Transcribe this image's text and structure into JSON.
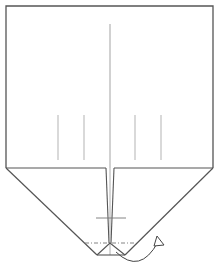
{
  "diagram": {
    "type": "origami-fold-step",
    "colors": {
      "background": "#ffffff",
      "edge": "#555555",
      "crease": "#9a9a9a",
      "valley": "#777777",
      "arrow": "#444444"
    },
    "paper": {
      "rect": {
        "x1": 6,
        "y1": 6,
        "x2": 213,
        "y2": 168
      },
      "left_flap": [
        [
          6,
          168
        ],
        [
          106,
          168
        ],
        [
          106,
          243
        ],
        [
          97,
          255
        ]
      ],
      "right_flap": [
        [
          213,
          168
        ],
        [
          114,
          168
        ],
        [
          114,
          243
        ],
        [
          125,
          255
        ]
      ]
    },
    "creases": {
      "center": {
        "x": 110,
        "y1": 24,
        "y2": 255
      },
      "short_verticals": [
        {
          "x": 58,
          "y1": 115,
          "y2": 160
        },
        {
          "x": 84,
          "y1": 115,
          "y2": 160
        },
        {
          "x": 135,
          "y1": 115,
          "y2": 160
        },
        {
          "x": 161,
          "y1": 115,
          "y2": 160
        }
      ],
      "cross_tick": {
        "x1": 96,
        "x2": 126,
        "y": 218
      }
    },
    "fold_line": {
      "x1": 85,
      "x2": 135,
      "y": 243,
      "style": "dash-dot"
    },
    "bottom_triangle": [
      [
        97,
        255
      ],
      [
        110,
        243
      ],
      [
        125,
        255
      ]
    ],
    "arrow": {
      "label": "fold-behind-arrow",
      "path": "M 116 252 Q 140 275 158 242",
      "head": [
        [
          157,
          237
        ],
        [
          163,
          244
        ],
        [
          155,
          246
        ]
      ]
    }
  }
}
